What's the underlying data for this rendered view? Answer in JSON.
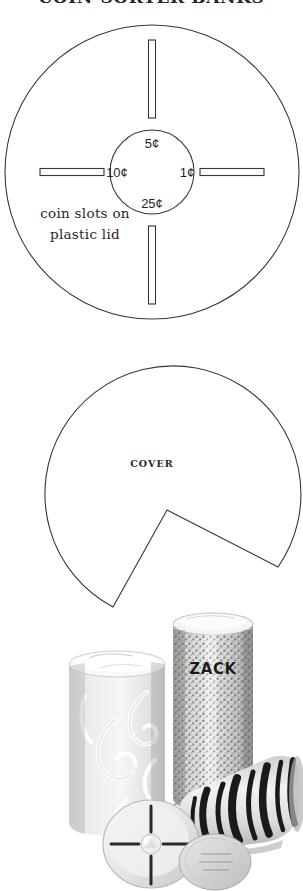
{
  "page": {
    "title": "COIN-SORTER BANKS",
    "background_color": "#ffffff",
    "ink_color": "#3b3537"
  },
  "lid_diagram": {
    "name": "coin-slot-lid-diagram",
    "caption_line_1": "coin slots on",
    "caption_line_2": "plastic lid",
    "coin_labels": {
      "top": "5¢",
      "left": "10¢",
      "right": "1¢",
      "bottom": "25¢"
    },
    "slot_count": 4,
    "outer_circle": {
      "cx": 152,
      "cy": 150,
      "r": 148
    },
    "inner_circle": {
      "cx": 152,
      "cy": 150,
      "r": 42
    }
  },
  "cover_diagram": {
    "name": "cover-template-diagram",
    "label": "COVER",
    "circle": {
      "cx": 158,
      "cy": 138,
      "r": 128
    },
    "notch_apex": {
      "x": 167,
      "y": 158
    }
  },
  "photo": {
    "name": "finished-coin-banks-photo",
    "alt": "Three decorated cylindrical coin-sorter banks",
    "personalized_label": "ZACK",
    "banks": [
      {
        "name": "swirl-bank",
        "pattern": "white swirls on pale ground"
      },
      {
        "name": "glitter-bank",
        "pattern": "silver glitter sequins",
        "label": "ZACK"
      },
      {
        "name": "zebra-bank",
        "pattern": "black and white zebra stripes"
      }
    ]
  }
}
